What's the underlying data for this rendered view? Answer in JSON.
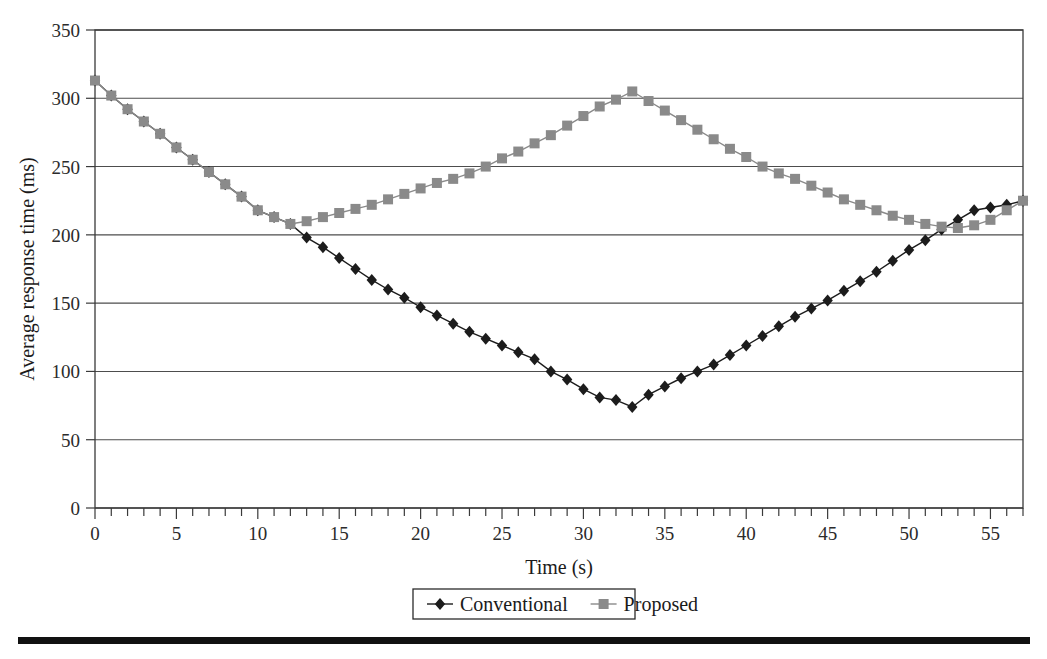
{
  "chart_data": {
    "type": "line",
    "title": "",
    "xlabel": "Time (s)",
    "ylabel": "Average response time (ms)",
    "xlim": [
      0,
      57
    ],
    "ylim": [
      0,
      350
    ],
    "ytick_step": 50,
    "xtick_step": 1,
    "xtick_label_step": 5,
    "grid": "horizontal",
    "legend_position": "bottom-center",
    "x_tick_labels": [
      "0",
      "5",
      "10",
      "15",
      "20",
      "25",
      "30",
      "35",
      "40",
      "45",
      "50",
      "55"
    ],
    "x_tick_values": [
      0,
      5,
      10,
      15,
      20,
      25,
      30,
      35,
      40,
      45,
      50,
      55
    ],
    "y_tick_labels": [
      "0",
      "50",
      "100",
      "150",
      "200",
      "250",
      "300",
      "350"
    ],
    "y_tick_values": [
      0,
      50,
      100,
      150,
      200,
      250,
      300,
      350
    ],
    "x": [
      0,
      1,
      2,
      3,
      4,
      5,
      6,
      7,
      8,
      9,
      10,
      11,
      12,
      13,
      14,
      15,
      16,
      17,
      18,
      19,
      20,
      21,
      22,
      23,
      24,
      25,
      26,
      27,
      28,
      29,
      30,
      31,
      32,
      33,
      34,
      35,
      36,
      37,
      38,
      39,
      40,
      41,
      42,
      43,
      44,
      45,
      46,
      47,
      48,
      49,
      50,
      51,
      52,
      53,
      54,
      55,
      56,
      57
    ],
    "series": [
      {
        "name": "Conventional",
        "color": "#1c1c1c",
        "marker": "diamond",
        "values": [
          313,
          302,
          292,
          283,
          274,
          264,
          255,
          246,
          237,
          228,
          218,
          213,
          208,
          198,
          191,
          183,
          175,
          167,
          160,
          154,
          147,
          141,
          135,
          129,
          124,
          119,
          114,
          109,
          100,
          94,
          87,
          81,
          79,
          74,
          83,
          89,
          95,
          100,
          105,
          112,
          119,
          126,
          133,
          140,
          146,
          152,
          159,
          166,
          173,
          181,
          189,
          196,
          204,
          211,
          218,
          220,
          222,
          225
        ]
      },
      {
        "name": "Proposed",
        "color": "#8a8a8a",
        "marker": "square",
        "values": [
          313,
          302,
          292,
          283,
          274,
          264,
          255,
          246,
          237,
          228,
          218,
          213,
          208,
          210,
          213,
          216,
          219,
          222,
          226,
          230,
          234,
          238,
          241,
          245,
          250,
          256,
          261,
          267,
          273,
          280,
          287,
          294,
          299,
          305,
          298,
          291,
          284,
          277,
          270,
          263,
          257,
          250,
          245,
          241,
          236,
          231,
          226,
          222,
          218,
          214,
          211,
          208,
          206,
          205,
          207,
          211,
          218,
          225
        ]
      }
    ]
  },
  "legend": {
    "items": [
      {
        "label": "Conventional",
        "marker": "diamond",
        "color": "#1c1c1c"
      },
      {
        "label": "Proposed",
        "marker": "square",
        "color": "#8a8a8a"
      }
    ]
  }
}
